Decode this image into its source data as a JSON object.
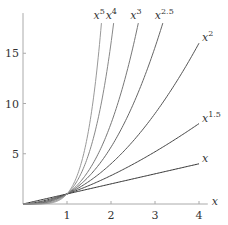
{
  "chart_data": {
    "type": "line",
    "title": "",
    "xlabel": "x",
    "ylabel": "",
    "xlim": [
      0,
      4.2
    ],
    "ylim": [
      0,
      19
    ],
    "grid": false,
    "legend": "inline labels at curve ends",
    "x_ticks": [
      1,
      2,
      3,
      4
    ],
    "y_ticks": [
      5,
      10,
      15
    ],
    "series": [
      {
        "name": "x",
        "base": "x",
        "exp": "",
        "power": 1,
        "x_end": 4,
        "color": "#333333"
      },
      {
        "name": "x^1.5",
        "base": "x",
        "exp": "1.5",
        "power": 1.5,
        "x_end": 4,
        "color": "#444444"
      },
      {
        "name": "x^2",
        "base": "x",
        "exp": "2",
        "power": 2,
        "x_end": 4,
        "color": "#555555"
      },
      {
        "name": "x^2.5",
        "base": "x",
        "exp": "2.5",
        "power": 2.5,
        "y_end": 18,
        "color": "#666666"
      },
      {
        "name": "x^3",
        "base": "x",
        "exp": "3",
        "power": 3,
        "y_end": 18,
        "color": "#777777"
      },
      {
        "name": "x^4",
        "base": "x",
        "exp": "4",
        "power": 4,
        "y_end": 18,
        "color": "#888888"
      },
      {
        "name": "x^5",
        "base": "x",
        "exp": "5",
        "power": 5,
        "y_end": 18,
        "color": "#999999"
      }
    ]
  },
  "layout": {
    "origin_px": [
      23,
      204
    ],
    "px_per_x": 44,
    "px_per_y": 10.05,
    "axis_color": "#aaaaaa"
  }
}
